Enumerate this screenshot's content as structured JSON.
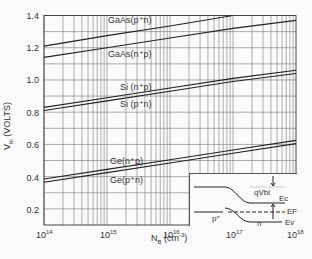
{
  "chart_data": {
    "type": "line",
    "title": "",
    "xlabel": "N_B (cm^-3)",
    "ylabel": "V_bi (VOLTS)",
    "x_scale": "log",
    "xlim": [
      100000000000000.0,
      1e+18
    ],
    "ylim": [
      0.1,
      1.4
    ],
    "x_ticks": [
      "10^14",
      "10^15",
      "10^16",
      "10^17",
      "10^18"
    ],
    "y_ticks": [
      "0.2",
      "0.4",
      "0.6",
      "0.8",
      "1.0",
      "1.2",
      "1.4"
    ],
    "grid": true,
    "x": [
      100000000000000.0,
      1000000000000000.0,
      1e+16,
      1e+17,
      1e+18
    ],
    "series": [
      {
        "name": "GaAs(p+n)",
        "values": [
          1.21,
          1.275,
          1.335,
          1.4,
          null
        ]
      },
      {
        "name": "GaAs(n+p)",
        "values": [
          1.14,
          1.2,
          1.26,
          1.32,
          1.37
        ]
      },
      {
        "name": "Si(n+p)",
        "values": [
          0.83,
          0.89,
          0.95,
          1.01,
          1.06
        ]
      },
      {
        "name": "Si(p+n)",
        "values": [
          0.81,
          0.87,
          0.93,
          0.99,
          1.04
        ]
      },
      {
        "name": "Ge(n+p)",
        "values": [
          0.385,
          0.445,
          0.505,
          0.565,
          0.625
        ]
      },
      {
        "name": "Ge(p+n)",
        "values": [
          0.365,
          0.425,
          0.485,
          0.545,
          0.605
        ]
      }
    ],
    "annotations": [
      "GaAs(p+n)",
      "GaAs(n+p)",
      "Si (n+p)",
      "Si (p+n)",
      "Ge(n+p)",
      "Ge(p+n)"
    ],
    "inset": {
      "description": "Band diagram of p+n junction",
      "labels": [
        "qVbi",
        "Ec",
        "EF",
        "Ev",
        "p+",
        "n"
      ]
    }
  },
  "labels": {
    "y_axis_title": "V",
    "y_axis_sub": "bi",
    "y_axis_units": " (VOLTS)",
    "x_axis_title": "N",
    "x_axis_sub": "B",
    "x_axis_units": " (cm",
    "x_axis_exp": "-3",
    "x_axis_close": ")",
    "y_ticks": [
      "1.4",
      "1.2",
      "1.0",
      "0.8",
      "0.6",
      "0.4",
      "0.2"
    ],
    "x_base": "10",
    "x_exps": [
      "14",
      "15",
      "16",
      "17",
      "18"
    ],
    "curves": {
      "gaas_pn": "GaAs(p⁺n)",
      "gaas_np": "GaAs(n⁺p)",
      "si_np": "Si (n⁺p)",
      "si_pn": "Si (p⁺n)",
      "ge_np": "Ge(n⁺p)",
      "ge_pn": "Ge(p⁺n)"
    },
    "inset": {
      "qvbi": "qVbi",
      "ec": "Ec",
      "ef": "EF",
      "ev": "Ev",
      "pplus": "p⁺",
      "n": "n"
    }
  }
}
